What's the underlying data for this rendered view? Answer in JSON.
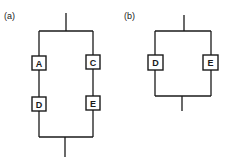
{
  "diagram": {
    "panels": [
      {
        "id": "a",
        "label": "(a)",
        "branches": [
          {
            "components": [
              "A",
              "D"
            ]
          },
          {
            "components": [
              "C",
              "E"
            ]
          }
        ]
      },
      {
        "id": "b",
        "label": "(b)",
        "branches": [
          {
            "components": [
              "D"
            ]
          },
          {
            "components": [
              "E"
            ]
          }
        ]
      }
    ],
    "colors": {
      "line": "#1a1a1a",
      "background": "#ffffff"
    }
  }
}
